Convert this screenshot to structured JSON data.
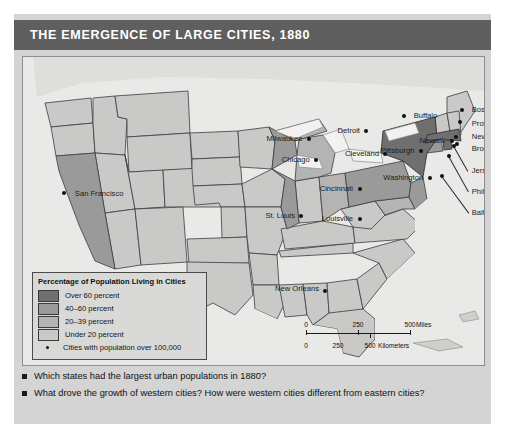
{
  "title": "THE EMERGENCE OF LARGE CITIES, 1880",
  "colors": {
    "title_bar": "#5f5f5f",
    "panel": "#d4d4d4",
    "ocean": "#e9e9e7",
    "over_60": "#6f6f6f",
    "forty_to_60": "#9a9a9a",
    "twenty_to_39": "#b4b4b4",
    "under_20": "#c9c9c7",
    "city_dot": "#111111"
  },
  "legend": {
    "title": "Percentage of Population Living in Cities",
    "classes": [
      {
        "label": "Over 60 percent",
        "color": "#6f6f6f"
      },
      {
        "label": "40–60 percent",
        "color": "#9a9a9a"
      },
      {
        "label": "20–39 percent",
        "color": "#b4b4b4"
      },
      {
        "label": "Under 20 percent",
        "color": "#c9c9c7"
      }
    ],
    "point_label": "Cities with population over 100,000"
  },
  "scale": {
    "miles": {
      "ticks": [
        "0",
        "250",
        "500"
      ],
      "unit": "Miles"
    },
    "kilometers": {
      "ticks": [
        "0",
        "250",
        "500"
      ],
      "unit": "Kilometers"
    }
  },
  "cities": [
    {
      "name": "San Francisco",
      "anchor": "right",
      "dot_x": 9.0,
      "dot_y": 44.0,
      "label_x": 10.6,
      "label_y": 44.5
    },
    {
      "name": "Milwaukee",
      "anchor": "left",
      "dot_x": 62.0,
      "dot_y": 26.5,
      "label_x": 60.6,
      "label_y": 26.5
    },
    {
      "name": "Chicago",
      "anchor": "left",
      "dot_x": 63.6,
      "dot_y": 33.6,
      "label_x": 62.2,
      "label_y": 33.6
    },
    {
      "name": "St. Louis",
      "anchor": "left",
      "dot_x": 60.4,
      "dot_y": 51.5,
      "label_x": 59.0,
      "label_y": 51.5
    },
    {
      "name": "Detroit",
      "anchor": "left",
      "dot_x": 74.5,
      "dot_y": 24.0,
      "label_x": 73.1,
      "label_y": 24.0
    },
    {
      "name": "Cleveland",
      "anchor": "left",
      "dot_x": 78.6,
      "dot_y": 31.4,
      "label_x": 77.2,
      "label_y": 31.4
    },
    {
      "name": "Cincinnati",
      "anchor": "left",
      "dot_x": 73.0,
      "dot_y": 42.8,
      "label_x": 71.6,
      "label_y": 42.8
    },
    {
      "name": "Louisville",
      "anchor": "left",
      "dot_x": 73.0,
      "dot_y": 52.5,
      "label_x": 71.6,
      "label_y": 52.5
    },
    {
      "name": "Buffalo",
      "anchor": "right",
      "dot_x": 82.6,
      "dot_y": 19.2,
      "label_x": 84.1,
      "label_y": 19.2
    },
    {
      "name": "Pittsburgh",
      "anchor": "left",
      "dot_x": 86.3,
      "dot_y": 30.5,
      "label_x": 84.9,
      "label_y": 30.5
    },
    {
      "name": "Washington",
      "anchor": "left",
      "dot_x": 88.2,
      "dot_y": 39.4,
      "label_x": 86.8,
      "label_y": 39.4
    },
    {
      "name": "Newark",
      "anchor": "left",
      "dot_x": 93.0,
      "dot_y": 27.3,
      "label_x": 91.6,
      "label_y": 27.3
    },
    {
      "name": "Boston",
      "anchor": "right",
      "dot_x": 95.2,
      "dot_y": 17.1,
      "label_x": 96.7,
      "label_y": 17.1
    },
    {
      "name": "Providence",
      "anchor": "right",
      "dot_x": 94.8,
      "dot_y": 21.0,
      "label_x": 96.7,
      "label_y": 21.8
    },
    {
      "name": "New York",
      "anchor": "right",
      "dot_x": 94.0,
      "dot_y": 26.0,
      "label_x": 96.7,
      "label_y": 26.0
    },
    {
      "name": "Brooklyn",
      "anchor": "right",
      "dot_x": 94.2,
      "dot_y": 28.4,
      "label_x": 96.7,
      "label_y": 30.0
    },
    {
      "name": "Jersey City",
      "anchor": "right",
      "dot_x": 93.6,
      "dot_y": 28.8,
      "label_x": 96.7,
      "label_y": 37.0
    },
    {
      "name": "Philadelphia",
      "anchor": "right",
      "dot_x": 92.4,
      "dot_y": 32.2,
      "label_x": 96.7,
      "label_y": 43.8
    },
    {
      "name": "Baltimore",
      "anchor": "right",
      "dot_x": 90.8,
      "dot_y": 38.6,
      "label_x": 96.7,
      "label_y": 50.6
    },
    {
      "name": "New Orleans",
      "anchor": "left",
      "dot_x": 65.6,
      "dot_y": 76.0,
      "label_x": 64.2,
      "label_y": 75.2
    }
  ],
  "questions": [
    "Which states had the largest urban populations in 1880?",
    "What drove the growth of western cities? How were western cities different from eastern cities?"
  ]
}
